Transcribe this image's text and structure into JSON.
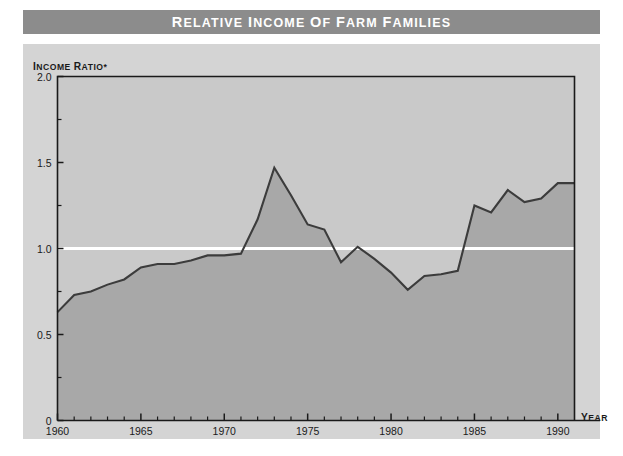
{
  "title": "Relative Income of Farm Families",
  "colors": {
    "title_bar": "#8c8c8c",
    "title_text": "#ffffff",
    "panel_bg": "#d4d4d4",
    "plot_bg": "#c9c9c9",
    "area_fill": "#a8a8a8",
    "line": "#3c3c3c",
    "reference_line": "#ffffff",
    "axis": "#1a1a1a",
    "page_bg": "#ffffff"
  },
  "chart_data": {
    "type": "area",
    "title": "Relative Income of Farm Families",
    "xlabel": "Year",
    "ylabel": "Income Ratio*",
    "xlim": [
      1960,
      1991
    ],
    "ylim": [
      0,
      2.0
    ],
    "grid": false,
    "legend": "none",
    "yticks": [
      "0",
      "0.5",
      "1.0",
      "1.5",
      "2.0"
    ],
    "ytick_values": [
      0,
      0.5,
      1.0,
      1.5,
      2.0
    ],
    "yminor_step": 0.25,
    "xticks": [
      "1960",
      "1965",
      "1970",
      "1975",
      "1980",
      "1985",
      "1990"
    ],
    "xtick_values": [
      1960,
      1965,
      1970,
      1975,
      1980,
      1985,
      1990
    ],
    "xminor_step": 1,
    "reference_line": {
      "value": 1.0,
      "label": "1.0 parity"
    },
    "x": [
      1960,
      1961,
      1962,
      1963,
      1964,
      1965,
      1966,
      1967,
      1968,
      1969,
      1970,
      1971,
      1972,
      1973,
      1974,
      1975,
      1976,
      1977,
      1978,
      1979,
      1980,
      1981,
      1982,
      1983,
      1984,
      1985,
      1986,
      1987,
      1988,
      1989,
      1990
    ],
    "series": [
      {
        "name": "Income ratio",
        "values": [
          0.63,
          0.73,
          0.75,
          0.79,
          0.82,
          0.89,
          0.91,
          0.91,
          0.93,
          0.96,
          0.96,
          0.97,
          1.17,
          1.47,
          1.31,
          1.14,
          1.11,
          0.92,
          1.01,
          0.94,
          0.86,
          0.76,
          0.84,
          0.85,
          0.87,
          1.25,
          1.21,
          1.34,
          1.27,
          1.29,
          1.38
        ]
      }
    ],
    "footnote_marker": "*"
  }
}
